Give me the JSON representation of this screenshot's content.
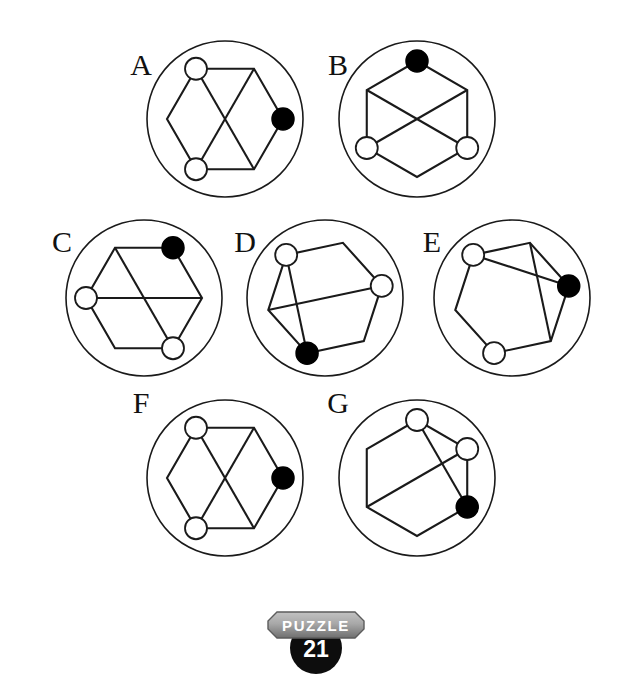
{
  "page": {
    "background_color": "#ffffff",
    "ink_color": "#1a1a1a",
    "filled_node_color": "#000000",
    "open_node_fill": "#ffffff",
    "width": 632,
    "height": 678
  },
  "badge": {
    "word": "PUZZLE",
    "number": "21",
    "banner_color_light": "#b9b9b9",
    "banner_color_dark": "#6f6f6f",
    "circle_color": "#0d0d0d",
    "text_color": "#ffffff"
  },
  "panels": [
    {
      "id": "A",
      "label": "A",
      "label_x": 141,
      "label_y": 75,
      "cx": 225,
      "cy": 119,
      "r": 78,
      "rotation": 0,
      "hex_radius": 58,
      "node_radius_open": 11,
      "node_radius_filled": 11,
      "vertices": [
        {
          "index": 0,
          "angle_deg": 0,
          "marker": "filled"
        },
        {
          "index": 1,
          "angle_deg": 60,
          "marker": "none"
        },
        {
          "index": 2,
          "angle_deg": 120,
          "marker": "open"
        },
        {
          "index": 3,
          "angle_deg": 180,
          "marker": "none"
        },
        {
          "index": 4,
          "angle_deg": 240,
          "marker": "open"
        },
        {
          "index": 5,
          "angle_deg": 300,
          "marker": "none"
        }
      ],
      "chords": [
        [
          2,
          5
        ],
        [
          4,
          1
        ]
      ]
    },
    {
      "id": "B",
      "label": "B",
      "label_x": 338,
      "label_y": 75,
      "cx": 417,
      "cy": 119,
      "r": 78,
      "rotation": 90,
      "hex_radius": 58,
      "node_radius_open": 11,
      "node_radius_filled": 11,
      "vertices": [
        {
          "index": 0,
          "angle_deg": 0,
          "marker": "filled"
        },
        {
          "index": 1,
          "angle_deg": 60,
          "marker": "none"
        },
        {
          "index": 2,
          "angle_deg": 120,
          "marker": "open"
        },
        {
          "index": 3,
          "angle_deg": 180,
          "marker": "none"
        },
        {
          "index": 4,
          "angle_deg": 240,
          "marker": "open"
        },
        {
          "index": 5,
          "angle_deg": 300,
          "marker": "none"
        }
      ],
      "chords": [
        [
          2,
          5
        ],
        [
          4,
          1
        ]
      ]
    },
    {
      "id": "C",
      "label": "C",
      "label_x": 62,
      "label_y": 252,
      "cx": 144,
      "cy": 298,
      "r": 78,
      "rotation": 60,
      "hex_radius": 58,
      "node_radius_open": 11,
      "node_radius_filled": 11,
      "vertices": [
        {
          "index": 0,
          "angle_deg": 0,
          "marker": "filled"
        },
        {
          "index": 1,
          "angle_deg": 60,
          "marker": "none"
        },
        {
          "index": 2,
          "angle_deg": 120,
          "marker": "open"
        },
        {
          "index": 3,
          "angle_deg": 180,
          "marker": "none"
        },
        {
          "index": 4,
          "angle_deg": 240,
          "marker": "open"
        },
        {
          "index": 5,
          "angle_deg": 300,
          "marker": "none"
        }
      ],
      "chords": [
        [
          2,
          5
        ],
        [
          4,
          1
        ]
      ]
    },
    {
      "id": "D",
      "label": "D",
      "label_x": 245,
      "label_y": 252,
      "cx": 325,
      "cy": 298,
      "r": 78,
      "rotation": 252,
      "hex_radius": 58,
      "node_radius_open": 11,
      "node_radius_filled": 11,
      "vertices": [
        {
          "index": 0,
          "angle_deg": 0,
          "marker": "filled"
        },
        {
          "index": 1,
          "angle_deg": 60,
          "marker": "none"
        },
        {
          "index": 2,
          "angle_deg": 120,
          "marker": "open"
        },
        {
          "index": 3,
          "angle_deg": 180,
          "marker": "none"
        },
        {
          "index": 4,
          "angle_deg": 240,
          "marker": "open"
        },
        {
          "index": 5,
          "angle_deg": 300,
          "marker": "none"
        }
      ],
      "chords": [
        [
          0,
          4
        ],
        [
          2,
          5
        ]
      ]
    },
    {
      "id": "E",
      "label": "E",
      "label_x": 432,
      "label_y": 252,
      "cx": 512,
      "cy": 298,
      "r": 78,
      "rotation": 12,
      "hex_radius": 58,
      "node_radius_open": 11,
      "node_radius_filled": 11,
      "vertices": [
        {
          "index": 0,
          "angle_deg": 0,
          "marker": "filled"
        },
        {
          "index": 1,
          "angle_deg": 60,
          "marker": "none"
        },
        {
          "index": 2,
          "angle_deg": 120,
          "marker": "open"
        },
        {
          "index": 3,
          "angle_deg": 180,
          "marker": "none"
        },
        {
          "index": 4,
          "angle_deg": 240,
          "marker": "open"
        },
        {
          "index": 5,
          "angle_deg": 300,
          "marker": "none"
        }
      ],
      "chords": [
        [
          0,
          2
        ],
        [
          5,
          1
        ]
      ]
    },
    {
      "id": "F",
      "label": "F",
      "label_x": 141,
      "label_y": 413,
      "cx": 225,
      "cy": 478,
      "r": 78,
      "rotation": 0,
      "hex_radius": 58,
      "node_radius_open": 11,
      "node_radius_filled": 11,
      "vertices": [
        {
          "index": 0,
          "angle_deg": 0,
          "marker": "filled"
        },
        {
          "index": 1,
          "angle_deg": 60,
          "marker": "none"
        },
        {
          "index": 2,
          "angle_deg": 120,
          "marker": "open"
        },
        {
          "index": 3,
          "angle_deg": 180,
          "marker": "none"
        },
        {
          "index": 4,
          "angle_deg": 240,
          "marker": "open"
        },
        {
          "index": 5,
          "angle_deg": 300,
          "marker": "none"
        }
      ],
      "chords": [
        [
          2,
          5
        ],
        [
          4,
          1
        ]
      ]
    },
    {
      "id": "G",
      "label": "G",
      "label_x": 338,
      "label_y": 413,
      "cx": 417,
      "cy": 478,
      "r": 78,
      "rotation": 330,
      "hex_radius": 58,
      "node_radius_open": 11,
      "node_radius_filled": 11,
      "vertices": [
        {
          "index": 0,
          "angle_deg": 0,
          "marker": "filled"
        },
        {
          "index": 1,
          "angle_deg": 60,
          "marker": "open"
        },
        {
          "index": 2,
          "angle_deg": 120,
          "marker": "open"
        },
        {
          "index": 3,
          "angle_deg": 180,
          "marker": "none"
        },
        {
          "index": 4,
          "angle_deg": 240,
          "marker": "none"
        },
        {
          "index": 5,
          "angle_deg": 300,
          "marker": "none"
        }
      ],
      "chords": [
        [
          1,
          4
        ],
        [
          2,
          0
        ]
      ]
    }
  ]
}
